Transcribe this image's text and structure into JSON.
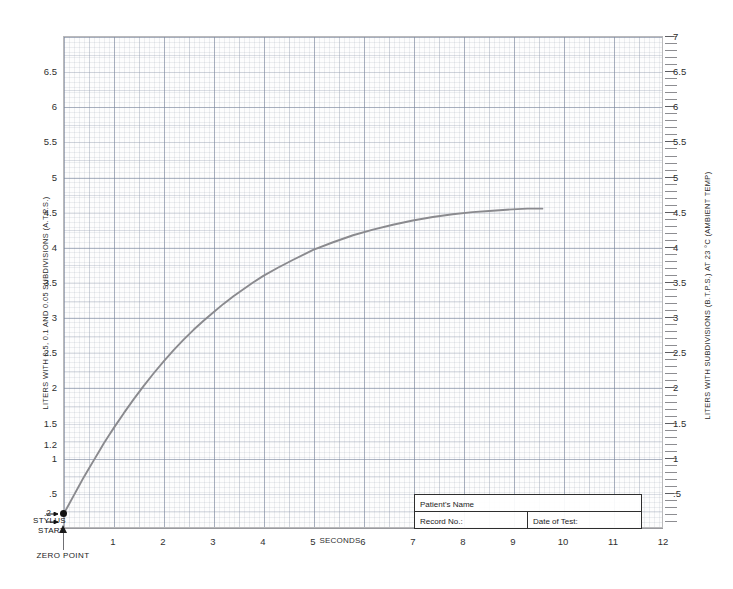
{
  "chart_data": {
    "type": "line",
    "title": "",
    "xlabel": "SECONDS",
    "ylabel": "LITERS WITH 0.5, 0.1 AND 0.05 SUBDIVISIONS (A.T.P.S.)",
    "ylabel_right": "LITERS WITH SUBDIVISIONS (B.T.P.S.) AT 23 °C (AMBIENT TEMP)",
    "xlim": [
      0,
      12
    ],
    "ylim": [
      0,
      7
    ],
    "grid": true,
    "legend": "none",
    "x_ticks": [
      "1",
      "2",
      "3",
      "4",
      "5",
      "6",
      "7",
      "8",
      "9",
      "10",
      "11",
      "12"
    ],
    "x_tick_values": [
      1,
      2,
      3,
      4,
      5,
      6,
      7,
      8,
      9,
      10,
      11,
      12
    ],
    "y_ticks_left": [
      ".5",
      "1",
      "1.2",
      "1.5",
      "2",
      "2.5",
      "3",
      "3.5",
      "4",
      "4.5",
      "5",
      "5.5",
      "6",
      "6.5"
    ],
    "y_tick_values_left": [
      0.5,
      1,
      1.2,
      1.5,
      2,
      2.5,
      3,
      3.5,
      4,
      4.5,
      5,
      5.5,
      6,
      6.5
    ],
    "y_ticks_right": [
      ".5",
      "1",
      "1.5",
      "2",
      "2.5",
      "3",
      "3.5",
      "4",
      "4.5",
      "5",
      "5.5",
      "6",
      "6.5",
      "7"
    ],
    "y_tick_values_right": [
      0.5,
      1,
      1.5,
      2,
      2.5,
      3,
      3.5,
      4,
      4.5,
      5,
      5.5,
      6,
      6.5,
      7
    ],
    "series": [
      {
        "name": "Slow vital capacity spirogram",
        "color": "#8a8a8e",
        "x": [
          0.0,
          0.1,
          0.2,
          0.3,
          0.4,
          0.5,
          0.6,
          0.7,
          0.8,
          0.9,
          1.0,
          1.2,
          1.4,
          1.6,
          1.8,
          2.0,
          2.2,
          2.4,
          2.6,
          2.8,
          3.0,
          3.2,
          3.4,
          3.6,
          3.8,
          4.0,
          4.3,
          4.6,
          5.0,
          5.4,
          5.8,
          6.2,
          6.6,
          7.0,
          7.4,
          7.8,
          8.2,
          8.6,
          9.0,
          9.3,
          9.6
        ],
        "y": [
          0.2,
          0.33,
          0.46,
          0.59,
          0.72,
          0.84,
          0.96,
          1.08,
          1.2,
          1.31,
          1.42,
          1.63,
          1.83,
          2.02,
          2.2,
          2.37,
          2.53,
          2.68,
          2.82,
          2.95,
          3.07,
          3.19,
          3.3,
          3.4,
          3.5,
          3.59,
          3.71,
          3.82,
          3.96,
          4.07,
          4.17,
          4.25,
          4.32,
          4.38,
          4.43,
          4.47,
          4.5,
          4.52,
          4.54,
          4.55,
          4.55
        ]
      }
    ],
    "annotations": {
      "stylus_label_line1": "STYLUS",
      "stylus_label_line2": "START",
      "stylus_start_value": ".2",
      "zero_point": "ZERO POINT"
    }
  },
  "form": {
    "patient_name_label": "Patient's Name",
    "record_no_label": "Record No.:",
    "date_of_test_label": "Date of Test:"
  }
}
